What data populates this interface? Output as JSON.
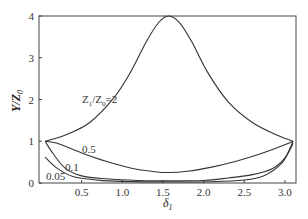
{
  "chart_data": {
    "type": "line",
    "title": "",
    "xlabel": "δ1",
    "ylabel": "Y/Z0",
    "xlim": [
      0,
      3.1416
    ],
    "ylim": [
      0,
      4
    ],
    "xticks": [
      "0.5",
      "1.0",
      "1.5",
      "2.0",
      "2.5",
      "3.0"
    ],
    "xtick_values": [
      0.5,
      1.0,
      1.5,
      2.0,
      2.5,
      3.0
    ],
    "yticks": [
      "0",
      "1",
      "2",
      "3",
      "4"
    ],
    "ytick_values": [
      0,
      1,
      2,
      3,
      4
    ],
    "grid": false,
    "legend": "inline annotations",
    "series": [
      {
        "name": "Z1/Z0=2",
        "label": "Z1/Z0=2",
        "x": [
          0.05,
          0.3,
          0.6,
          0.9,
          1.1,
          1.3,
          1.45,
          1.57,
          1.7,
          1.85,
          2.05,
          2.3,
          2.6,
          2.9,
          3.1
        ],
        "y": [
          1.0,
          1.15,
          1.45,
          2.05,
          2.65,
          3.4,
          3.85,
          4.0,
          3.85,
          3.4,
          2.65,
          1.95,
          1.45,
          1.15,
          1.0
        ]
      },
      {
        "name": "0.5",
        "label": "0.5",
        "x": [
          0.05,
          0.2,
          0.5,
          0.8,
          1.1,
          1.4,
          1.57,
          1.8,
          2.1,
          2.4,
          2.7,
          2.95,
          3.1
        ],
        "y": [
          1.0,
          0.95,
          0.72,
          0.52,
          0.36,
          0.27,
          0.25,
          0.28,
          0.38,
          0.52,
          0.7,
          0.88,
          1.0
        ]
      },
      {
        "name": "0.1",
        "label": "0.1",
        "x": [
          0.05,
          0.15,
          0.3,
          0.5,
          0.8,
          1.2,
          1.57,
          2.0,
          2.3,
          2.6,
          2.85,
          3.0,
          3.1
        ],
        "y": [
          1.0,
          0.7,
          0.35,
          0.17,
          0.1,
          0.06,
          0.05,
          0.06,
          0.12,
          0.2,
          0.35,
          0.6,
          1.0
        ]
      },
      {
        "name": "0.05",
        "label": "0.05",
        "x": [
          0.05,
          0.2,
          0.4,
          0.7,
          1.0,
          1.57,
          2.1,
          2.5,
          2.75,
          2.95,
          3.05,
          3.1
        ],
        "y": [
          0.62,
          0.35,
          0.15,
          0.07,
          0.04,
          0.025,
          0.03,
          0.07,
          0.18,
          0.45,
          0.75,
          0.95
        ]
      }
    ],
    "annotations": [
      {
        "text": "Z1/Z0=2",
        "x": 0.45,
        "y": 2.05
      },
      {
        "text": "0.5",
        "x": 0.42,
        "y": 0.72
      },
      {
        "text": "0.1",
        "x": 0.33,
        "y": 0.36
      },
      {
        "text": "0.05",
        "x": 0.15,
        "y": 0.12
      }
    ]
  },
  "labels": {
    "xlabel_main": "δ",
    "xlabel_sub": "1",
    "ylabel_main": "Y/Z",
    "ylabel_sub": "0",
    "annot_z_prefix": "Z",
    "annot_z_sub1": "1",
    "annot_z_mid": "/Z",
    "annot_z_sub0": "0",
    "annot_z_suffix": "=2",
    "annot_05": "0.5",
    "annot_01": "0.1",
    "annot_005": "0.05"
  }
}
